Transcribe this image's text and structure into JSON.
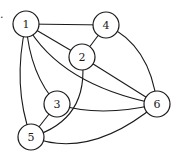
{
  "figure": {
    "mark": "."
  },
  "graph": {
    "nodes": [
      {
        "id": "1",
        "label": "1",
        "x": 26,
        "y": 24
      },
      {
        "id": "2",
        "label": "2",
        "x": 82,
        "y": 57
      },
      {
        "id": "3",
        "label": "3",
        "x": 57,
        "y": 104
      },
      {
        "id": "4",
        "label": "4",
        "x": 106,
        "y": 25
      },
      {
        "id": "5",
        "label": "5",
        "x": 31,
        "y": 137
      },
      {
        "id": "6",
        "label": "6",
        "x": 157,
        "y": 104
      }
    ],
    "edges": [
      {
        "from": "1",
        "to": "4"
      },
      {
        "from": "1",
        "to": "2"
      },
      {
        "from": "4",
        "to": "2"
      },
      {
        "from": "4",
        "to": "6"
      },
      {
        "from": "2",
        "to": "6"
      },
      {
        "from": "1",
        "to": "6"
      },
      {
        "from": "1",
        "to": "3"
      },
      {
        "from": "1",
        "to": "5"
      },
      {
        "from": "2",
        "to": "5"
      },
      {
        "from": "3",
        "to": "5"
      },
      {
        "from": "3",
        "to": "6"
      },
      {
        "from": "5",
        "to": "6"
      }
    ],
    "node_radius": 13,
    "stroke_color": "#1a1a1a",
    "fill_color": "#ffffff"
  }
}
